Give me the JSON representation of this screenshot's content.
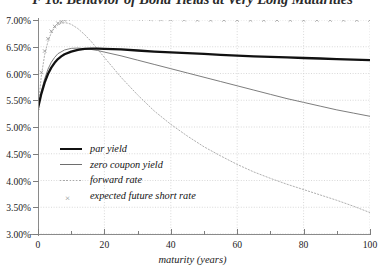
{
  "chart_data": {
    "type": "line",
    "title": "F 16. Behavior of Bond Yields at Very Long Maturities",
    "xlabel": "maturity (years)",
    "ylabel": "",
    "xlim": [
      0,
      100
    ],
    "ylim": [
      3.0,
      7.0
    ],
    "xticks": [
      0,
      20,
      40,
      60,
      80,
      100
    ],
    "xticklabels": [
      "0",
      "20",
      "40",
      "60",
      "80",
      "100"
    ],
    "xminorticks": [
      10,
      30,
      50,
      70,
      90
    ],
    "yticks": [
      3.0,
      3.5,
      4.0,
      4.5,
      5.0,
      5.5,
      6.0,
      6.5,
      7.0
    ],
    "yticklabels": [
      "3.00%",
      "3.50%",
      "4.00%",
      "4.50%",
      "5.00%",
      "5.50%",
      "6.00%",
      "6.50%",
      "7.00%"
    ],
    "grid": true,
    "grid_style": "dotted",
    "legend_position": "center-left",
    "colors": {
      "par_yield": "#111111",
      "zero_coupon_yield": "#6e6e6e",
      "forward_rate": "#b0b0b0",
      "expected_future_short_rate": "#8e8e8e",
      "grid": "#cfcfcf",
      "axis": "#8a8a8a",
      "background": "#ffffff"
    },
    "series": [
      {
        "name": "par yield",
        "style": "thick-solid",
        "x": [
          0,
          1,
          2,
          3,
          4,
          5,
          6,
          7,
          8,
          10,
          12,
          14,
          16,
          18,
          20,
          25,
          30,
          35,
          40,
          45,
          50,
          55,
          60,
          65,
          70,
          75,
          80,
          85,
          90,
          95,
          100
        ],
        "y": [
          5.35,
          5.62,
          5.83,
          5.99,
          6.11,
          6.2,
          6.27,
          6.32,
          6.36,
          6.41,
          6.44,
          6.46,
          6.465,
          6.465,
          6.46,
          6.45,
          6.43,
          6.41,
          6.395,
          6.38,
          6.365,
          6.35,
          6.335,
          6.32,
          6.31,
          6.3,
          6.29,
          6.28,
          6.27,
          6.26,
          6.25
        ]
      },
      {
        "name": "zero coupon yield",
        "style": "thin-solid",
        "x": [
          0,
          1,
          2,
          3,
          4,
          5,
          6,
          8,
          10,
          12,
          15,
          18,
          20,
          25,
          30,
          35,
          40,
          45,
          50,
          55,
          60,
          65,
          70,
          75,
          80,
          85,
          90,
          95,
          100
        ],
        "y": [
          5.35,
          5.66,
          5.9,
          6.08,
          6.21,
          6.3,
          6.37,
          6.44,
          6.47,
          6.475,
          6.46,
          6.43,
          6.4,
          6.33,
          6.25,
          6.17,
          6.09,
          6.01,
          5.93,
          5.85,
          5.77,
          5.69,
          5.61,
          5.53,
          5.46,
          5.39,
          5.32,
          5.26,
          5.2
        ]
      },
      {
        "name": "forward rate",
        "style": "dotted",
        "x": [
          0,
          1,
          2,
          3,
          4,
          5,
          6,
          7,
          8,
          9,
          10,
          12,
          14,
          16,
          18,
          20,
          25,
          30,
          35,
          40,
          45,
          50,
          55,
          60,
          65,
          70,
          75,
          80,
          85,
          90,
          95,
          100
        ],
        "y": [
          5.35,
          5.95,
          6.35,
          6.6,
          6.76,
          6.86,
          6.91,
          6.94,
          6.95,
          6.94,
          6.92,
          6.84,
          6.73,
          6.6,
          6.45,
          6.3,
          5.93,
          5.6,
          5.3,
          5.05,
          4.83,
          4.63,
          4.46,
          4.3,
          4.16,
          4.04,
          3.93,
          3.83,
          3.73,
          3.63,
          3.52,
          3.4
        ]
      },
      {
        "name": "expected future short rate",
        "style": "x-markers",
        "x": [
          0,
          1,
          2,
          3,
          4,
          5,
          6,
          7,
          8,
          9,
          10,
          11,
          12,
          13,
          14,
          15,
          17,
          19,
          21,
          23,
          25,
          28,
          31,
          34,
          37,
          40,
          44,
          48,
          52,
          56,
          60,
          64,
          68,
          72,
          76,
          80,
          84,
          88,
          92,
          96,
          100
        ],
        "y": [
          5.35,
          6.02,
          6.42,
          6.65,
          6.79,
          6.88,
          6.94,
          6.97,
          7.0,
          7.02,
          7.03,
          7.04,
          7.045,
          7.05,
          7.05,
          7.05,
          7.05,
          7.045,
          7.04,
          7.035,
          7.03,
          7.025,
          7.02,
          7.015,
          7.01,
          7.01,
          7.005,
          7.0,
          7.0,
          7.0,
          7.0,
          7.0,
          7.0,
          7.0,
          7.0,
          7.0,
          7.0,
          7.0,
          7.0,
          7.0,
          7.0
        ]
      }
    ],
    "legend": [
      "par yield",
      "zero coupon yield",
      "forward rate",
      "expected future short rate"
    ]
  }
}
